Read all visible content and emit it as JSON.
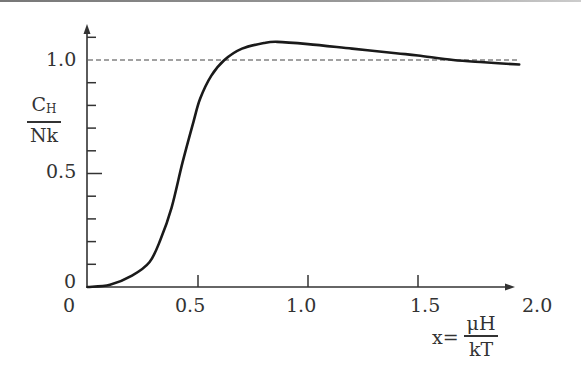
{
  "chart_data": {
    "type": "line",
    "title": "",
    "xlabel": "x = μH / kT",
    "ylabel": "C_H / Nk",
    "xlim": [
      0,
      2.0
    ],
    "ylim": [
      0,
      1.15
    ],
    "grid": false,
    "x_ticks": [
      "0",
      "0.5",
      "1.0",
      "1.5",
      "2.0"
    ],
    "y_ticks": [
      "0",
      "0.5",
      "1.0"
    ],
    "y_minor_tick_step": 0.1,
    "reference_line": {
      "y": 1.0,
      "style": "dashed"
    },
    "series": [
      {
        "name": "C_H/Nk",
        "x": [
          0,
          0.1,
          0.2,
          0.28,
          0.33,
          0.38,
          0.43,
          0.48,
          0.51,
          0.56,
          0.62,
          0.7,
          0.8,
          0.86,
          1.0,
          1.2,
          1.4,
          1.5,
          1.66,
          1.8,
          1.96
        ],
        "values": [
          0,
          0.01,
          0.05,
          0.11,
          0.21,
          0.35,
          0.55,
          0.73,
          0.83,
          0.93,
          1.0,
          1.05,
          1.075,
          1.08,
          1.07,
          1.05,
          1.03,
          1.02,
          1.0,
          0.99,
          0.98
        ]
      }
    ]
  },
  "axes": {
    "x_tick_labels": {
      "t0": "0",
      "t05": "0.5",
      "t10": "1.0",
      "t15": "1.5",
      "t20": "2.0"
    },
    "y_tick_labels": {
      "t0": "0",
      "t05": "0.5",
      "t10": "1.0"
    },
    "ylabel": {
      "num": "C",
      "num_sub": "H",
      "den": "Nk"
    },
    "xlabel": {
      "prefix": "x=",
      "num": "μH",
      "den": "kT"
    }
  }
}
